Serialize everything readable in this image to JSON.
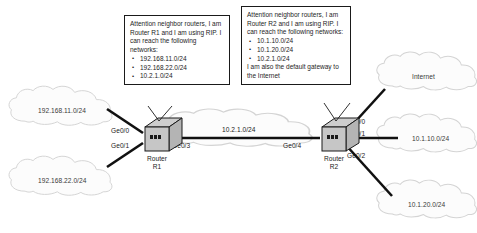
{
  "diagram": {
    "colors": {
      "line": "#111111",
      "cloud_fill": "#fbfbfb",
      "cloud_stroke": "#d2d2d2",
      "router_top": "#c9c9c9",
      "router_face": "#b8b8b8",
      "router_stroke": "#1a1a1a",
      "text": "#222222",
      "callout_border": "#1a1a1a",
      "background": "#ffffff"
    }
  },
  "callouts": [
    {
      "id": "r1-callout",
      "intro": "Attention neighbor routers, I am Router R1 and I am using RIP. I can reach the following networks:",
      "networks": [
        "192.168.11.0/24",
        "192.168.22.0/24",
        "10.2.1.0/24"
      ],
      "outro": ""
    },
    {
      "id": "r2-callout",
      "intro": "Attention neighbor routers, I am Router R2 and I am using RIP. I can reach the following networks:",
      "networks": [
        "10.1.10.0/24",
        "10.1.20.0/24",
        "10.2.1.0/24"
      ],
      "outro": "I am also the default gateway to the Internet"
    }
  ],
  "routers": [
    {
      "id": "r1",
      "line1": "Router",
      "line2": "R1"
    },
    {
      "id": "r2",
      "line1": "Router",
      "line2": "R2"
    }
  ],
  "clouds": [
    {
      "id": "cloud-192-168-11",
      "label": "192.168.11.0/24"
    },
    {
      "id": "cloud-192-168-22",
      "label": "192.168.22.0/24"
    },
    {
      "id": "cloud-core",
      "label": ""
    },
    {
      "id": "cloud-internet",
      "label": "Internet"
    },
    {
      "id": "cloud-10-1-10",
      "label": "10.1.10.0/24"
    },
    {
      "id": "cloud-10-1-20",
      "label": "10.1.20.0/24"
    }
  ],
  "interfaces": [
    {
      "id": "r1-ge00",
      "label": "Ge0/0"
    },
    {
      "id": "r1-ge01",
      "label": "Ge0/1"
    },
    {
      "id": "r1-ge03",
      "label": "Ge0/3"
    },
    {
      "id": "r2-ge04",
      "label": "Ge0/4"
    },
    {
      "id": "r2-ge00",
      "label": "Ge0/0"
    },
    {
      "id": "r2-ge01",
      "label": "Ge0/1"
    },
    {
      "id": "r2-ge02",
      "label": "Ge0/2"
    }
  ],
  "links": [
    {
      "id": "wan-link",
      "label": "10.2.1.0/24"
    }
  ]
}
